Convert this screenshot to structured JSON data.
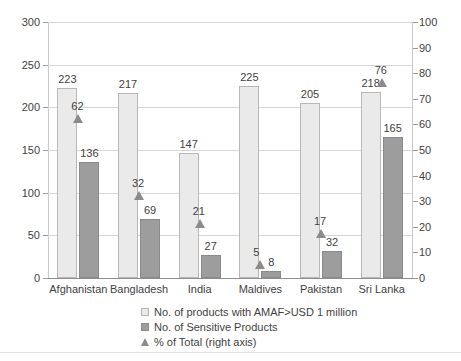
{
  "chart_data": {
    "type": "bar",
    "title": "",
    "xlabel": "",
    "ylabel": "",
    "categories": [
      "Afghanistan",
      "Bangladesh",
      "India",
      "Maldives",
      "Pakistan",
      "Sri Lanka"
    ],
    "series": [
      {
        "name": "No. of products with AMAF>USD 1 million",
        "axis": "left",
        "values": [
          223,
          217,
          147,
          225,
          205,
          218
        ]
      },
      {
        "name": "No. of Sensitive Products",
        "axis": "left",
        "values": [
          136,
          69,
          27,
          8,
          32,
          165
        ]
      },
      {
        "name": "% of Total (right axis)",
        "axis": "right",
        "type": "scatter",
        "marker": "triangle",
        "values": [
          62,
          32,
          21,
          5,
          17,
          76
        ]
      }
    ],
    "left_axis": {
      "ylim": [
        0,
        300
      ],
      "ticks": [
        0,
        50,
        100,
        150,
        200,
        250,
        300
      ],
      "tick_labels": [
        "0",
        "50",
        "100",
        "150",
        "200",
        "250",
        "300"
      ]
    },
    "right_axis": {
      "ylim": [
        0,
        100
      ],
      "ticks": [
        0,
        10,
        20,
        30,
        40,
        50,
        60,
        70,
        80,
        90,
        100
      ],
      "tick_labels": [
        "0",
        "10",
        "20",
        "30",
        "40",
        "50",
        "60",
        "70",
        "80",
        "90",
        "100"
      ]
    },
    "grid": true,
    "gridlines_from": "left_axis",
    "legend_position": "bottom-center",
    "legend": [
      {
        "label": "No. of products with AMAF>USD 1 million",
        "marker": "square-light",
        "color": "#eaeaea"
      },
      {
        "label": "No. of Sensitive Products",
        "marker": "square-dark",
        "color": "#9d9d9d"
      },
      {
        "label": "% of Total (right axis)",
        "marker": "triangle",
        "color": "#8b8b8b"
      }
    ],
    "colors": {
      "series_a": "#eaeaea",
      "series_a_border": "#b8b8b8",
      "series_b": "#9d9d9d",
      "series_b_border": "#8a8a8a",
      "marker": "#8b8b8b",
      "grid": "#d6d6d6",
      "axis": "#8e8e8e",
      "text": "#3f3f3f"
    }
  }
}
